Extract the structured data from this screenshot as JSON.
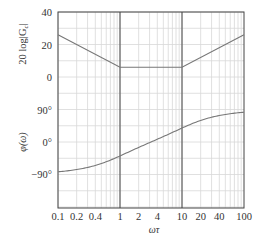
{
  "chart_data": {
    "type": "line",
    "title": "",
    "xlabel": "ωτ",
    "xscale": "log",
    "xlim": [
      0.1,
      100
    ],
    "x_ticks": [
      0.1,
      0.2,
      0.4,
      1,
      2,
      4,
      10,
      20,
      40,
      100
    ],
    "x_tick_labels": [
      "0.1",
      "0.2",
      "0.4",
      "1",
      "2",
      "4",
      "10",
      "20",
      "40",
      "100"
    ],
    "grid": true,
    "emphasized_vlines": [
      1,
      10
    ],
    "panels": [
      {
        "name": "magnitude",
        "ylabel": "20 log|G_c|",
        "ylim": [
          -10,
          40
        ],
        "y_ticks": [
          0,
          20,
          40
        ],
        "y_tick_labels": [
          "0",
          "20",
          "40"
        ],
        "series": [
          {
            "name": "asymptotic magnitude",
            "x": [
              0.1,
              1,
              10,
              100
            ],
            "values": [
              26,
              6,
              6,
              26
            ]
          }
        ]
      },
      {
        "name": "phase",
        "ylabel": "φ(ω)",
        "ylim": [
          -180,
          90
        ],
        "y_ticks": [
          -90,
          0,
          90
        ],
        "y_tick_labels": [
          "−90°",
          "0°",
          "90°"
        ],
        "series": [
          {
            "name": "phase",
            "x": [
              0.1,
              0.2,
              0.4,
              1,
              2,
              4,
              10,
              20,
              40,
              100
            ],
            "values": [
              -83.7,
              -77.5,
              -65.9,
              -39.3,
              -14.2,
              16.4,
              39.3,
              56.6,
              70.2,
              83.7
            ]
          }
        ]
      }
    ]
  },
  "labels": {
    "mag_ylabel_main": "20 log|G",
    "mag_ylabel_sub": "c",
    "mag_ylabel_end": "|",
    "phase_ylabel": "φ(ω)",
    "xlabel": "ωτ"
  }
}
